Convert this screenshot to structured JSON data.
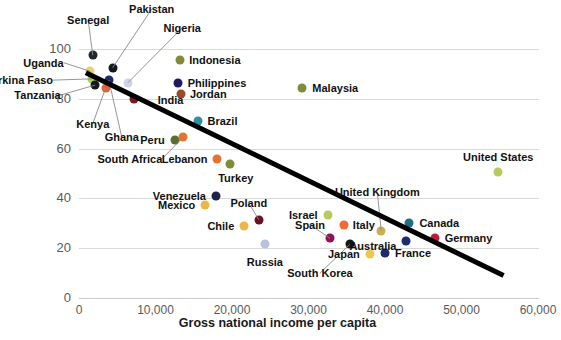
{
  "chart_data": {
    "type": "scatter",
    "title": "",
    "xlabel": "Gross national income per capita",
    "ylabel": "",
    "xlim": [
      0,
      62000
    ],
    "ylim": [
      0,
      108
    ],
    "grid": true,
    "legend": "none",
    "xticks": [
      "0",
      "10,000",
      "20,000",
      "30,000",
      "40,000",
      "50,000",
      "60,000"
    ],
    "xtick_values": [
      0,
      10000,
      20000,
      30000,
      40000,
      50000,
      60000
    ],
    "yticks": [
      "0",
      "20",
      "40",
      "60",
      "80",
      "100"
    ],
    "ytick_values": [
      0,
      20,
      40,
      60,
      80,
      100
    ],
    "trendline": {
      "x0": 900,
      "y0": 90.5,
      "x1": 55500,
      "y1": 9.0,
      "color": "#000000",
      "width": 5
    },
    "points": [
      {
        "name": "Senegal",
        "x": 1800,
        "y": 97.5,
        "color": "#23272e",
        "label_x": 1200,
        "label_y": 111.5,
        "anchor": "c",
        "leader": true
      },
      {
        "name": "Pakistan",
        "x": 4400,
        "y": 92.5,
        "color": "#15181d",
        "label_x": 9500,
        "label_y": 116.0,
        "anchor": "c",
        "leader": true
      },
      {
        "name": "Nigeria",
        "x": 6400,
        "y": 86.5,
        "color": "#cfd5e6",
        "label_x": 13500,
        "label_y": 108.5,
        "anchor": "c",
        "leader": true
      },
      {
        "name": "Uganda",
        "x": 1500,
        "y": 91.0,
        "color": "#e8d36a",
        "label_x": -2000,
        "label_y": 94.5,
        "anchor": "r",
        "leader": true
      },
      {
        "name": "Burkina Faso",
        "x": 1700,
        "y": 88.0,
        "color": "#aacf5c",
        "label_x": -3400,
        "label_y": 87.5,
        "anchor": "r",
        "leader": true
      },
      {
        "name": "Tanzania",
        "x": 2100,
        "y": 85.5,
        "color": "#18181b",
        "label_x": -2400,
        "label_y": 81.5,
        "anchor": "r",
        "leader": true
      },
      {
        "name": "Kenya",
        "x": 3500,
        "y": 84.5,
        "color": "#e06433",
        "label_x": 1800,
        "label_y": 70.0,
        "anchor": "c",
        "leader": true
      },
      {
        "name": "Ghana",
        "x": 3900,
        "y": 87.5,
        "color": "#1b2c6b",
        "label_x": 5600,
        "label_y": 64.5,
        "anchor": "c",
        "leader": true
      },
      {
        "name": "India",
        "x": 7200,
        "y": 80.0,
        "color": "#7b1a1e",
        "label_x": 10300,
        "label_y": 79.5,
        "anchor": "l",
        "leader": false
      },
      {
        "name": "Indonesia",
        "x": 13200,
        "y": 95.5,
        "color": "#7e8c3a",
        "label_x": 14400,
        "label_y": 95.5,
        "anchor": "l",
        "leader": false
      },
      {
        "name": "Philippines",
        "x": 13000,
        "y": 86.5,
        "color": "#221a5e",
        "label_x": 14200,
        "label_y": 86.5,
        "anchor": "l",
        "leader": false
      },
      {
        "name": "Jordan",
        "x": 13300,
        "y": 82.0,
        "color": "#9c4a22",
        "label_x": 14500,
        "label_y": 82.0,
        "anchor": "l",
        "leader": false
      },
      {
        "name": "Brazil",
        "x": 15500,
        "y": 71.0,
        "color": "#2e8f9e",
        "label_x": 16800,
        "label_y": 71.0,
        "anchor": "l",
        "leader": false
      },
      {
        "name": "Malaysia",
        "x": 29200,
        "y": 84.5,
        "color": "#7e8c3a",
        "label_x": 30500,
        "label_y": 84.5,
        "anchor": "l",
        "leader": false
      },
      {
        "name": "Peru",
        "x": 12500,
        "y": 63.5,
        "color": "#5a7030",
        "label_x": 11200,
        "label_y": 63.5,
        "anchor": "r",
        "leader": false
      },
      {
        "name": "South Africa",
        "x": 13600,
        "y": 64.5,
        "color": "#e8732e",
        "label_x": 10900,
        "label_y": 56.0,
        "anchor": "r",
        "leader": true
      },
      {
        "name": "Lebanon",
        "x": 18000,
        "y": 56.0,
        "color": "#e8732e",
        "label_x": 16800,
        "label_y": 56.0,
        "anchor": "r",
        "leader": false
      },
      {
        "name": "Turkey",
        "x": 19700,
        "y": 54.0,
        "color": "#7e8c3a",
        "label_x": 20500,
        "label_y": 48.0,
        "anchor": "c",
        "leader": false
      },
      {
        "name": "United States",
        "x": 54800,
        "y": 50.5,
        "color": "#b9c95e",
        "label_x": 54800,
        "label_y": 56.5,
        "anchor": "c",
        "leader": false
      },
      {
        "name": "Venezuela",
        "x": 17900,
        "y": 41.0,
        "color": "#1c2547",
        "label_x": 16600,
        "label_y": 41.0,
        "anchor": "r",
        "leader": false
      },
      {
        "name": "Mexico",
        "x": 16500,
        "y": 37.5,
        "color": "#edb64a",
        "label_x": 15200,
        "label_y": 37.5,
        "anchor": "r",
        "leader": false
      },
      {
        "name": "Poland",
        "x": 23500,
        "y": 31.5,
        "color": "#6b1126",
        "label_x": 22200,
        "label_y": 38.0,
        "anchor": "c",
        "leader": true
      },
      {
        "name": "Israel",
        "x": 32500,
        "y": 33.5,
        "color": "#b9c95e",
        "label_x": 31200,
        "label_y": 33.5,
        "anchor": "r",
        "leader": false
      },
      {
        "name": "Chile",
        "x": 21600,
        "y": 29.0,
        "color": "#edb64a",
        "label_x": 20300,
        "label_y": 29.0,
        "anchor": "r",
        "leader": false
      },
      {
        "name": "Spain",
        "x": 32800,
        "y": 24.0,
        "color": "#8c1452",
        "label_x": 30200,
        "label_y": 29.5,
        "anchor": "c",
        "leader": true
      },
      {
        "name": "Italy",
        "x": 34600,
        "y": 29.5,
        "color": "#ef6a35",
        "label_x": 35800,
        "label_y": 29.5,
        "anchor": "l",
        "leader": false
      },
      {
        "name": "United Kingdom",
        "x": 39500,
        "y": 27.0,
        "color": "#c9b04e",
        "label_x": 39000,
        "label_y": 42.5,
        "anchor": "c",
        "leader": true
      },
      {
        "name": "Canada",
        "x": 43200,
        "y": 30.0,
        "color": "#1d6f83",
        "label_x": 44500,
        "label_y": 30.0,
        "anchor": "l",
        "leader": false
      },
      {
        "name": "Germany",
        "x": 46500,
        "y": 24.0,
        "color": "#c01b3c",
        "label_x": 47800,
        "label_y": 24.0,
        "anchor": "l",
        "leader": false
      },
      {
        "name": "Australia",
        "x": 42800,
        "y": 23.0,
        "color": "#1c2a6e",
        "label_x": 41500,
        "label_y": 21.0,
        "anchor": "r",
        "leader": false
      },
      {
        "name": "France",
        "x": 40000,
        "y": 18.0,
        "color": "#1c2a6e",
        "label_x": 41300,
        "label_y": 18.0,
        "anchor": "l",
        "leader": false
      },
      {
        "name": "Russia",
        "x": 24300,
        "y": 21.5,
        "color": "#b9c1dc",
        "label_x": 24300,
        "label_y": 14.5,
        "anchor": "c",
        "leader": false
      },
      {
        "name": "Japan",
        "x": 38000,
        "y": 17.5,
        "color": "#edc84a",
        "label_x": 36700,
        "label_y": 17.5,
        "anchor": "r",
        "leader": false
      },
      {
        "name": "South Korea",
        "x": 35400,
        "y": 21.5,
        "color": "#151515",
        "label_x": 31500,
        "label_y": 10.0,
        "anchor": "c",
        "leader": true
      }
    ]
  }
}
